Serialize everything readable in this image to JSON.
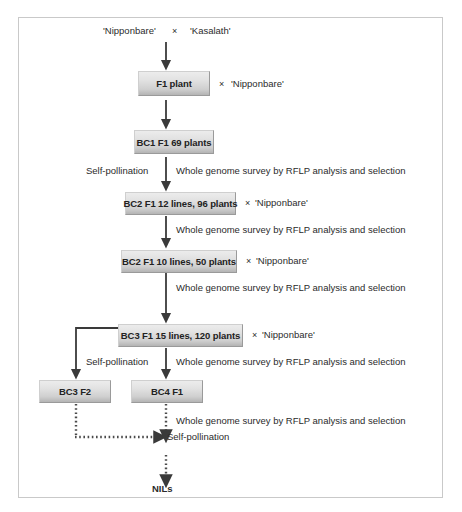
{
  "figure": {
    "frame_color": "#c9c9c9",
    "box_fill_top": "#ececec",
    "box_fill_bottom": "#b4b4b4",
    "box_border": "#9a9a9a",
    "arrow_color": "#3a3a3a",
    "text_color": "#2b2b2b"
  },
  "cross_top": {
    "parent_female": "'Nipponbare'",
    "cross_symbol": "×",
    "parent_male": "'Kasalath'"
  },
  "generations": [
    {
      "id": "f1-plant",
      "label": "F1 plant"
    },
    {
      "id": "bc1-f1",
      "label": "BC1 F1   69 plants"
    },
    {
      "id": "bc2-f1-12",
      "label": "BC2 F1 12 lines, 96 plants"
    },
    {
      "id": "bc2-f1-10",
      "label": "BC2 F1   10 lines, 50 plants"
    },
    {
      "id": "bc3-f1-15",
      "label": "BC3 F1   15 lines, 120 plants"
    },
    {
      "id": "bc3-f2",
      "label": "BC3 F2"
    },
    {
      "id": "bc4-f1",
      "label": "BC4 F1"
    }
  ],
  "recurrent_crosses": [
    {
      "id": "cross-f1",
      "symbol": "×",
      "parent": "'Nipponbare'"
    },
    {
      "id": "cross-bc2-12",
      "symbol": "×",
      "parent": "'Nipponbare'"
    },
    {
      "id": "cross-bc2-10",
      "symbol": "×",
      "parent": "'Nipponbare'"
    },
    {
      "id": "cross-bc3-15",
      "symbol": "×",
      "parent": "'Nipponbare'"
    }
  ],
  "step_labels": {
    "self_pollination": "Self-pollination",
    "rflp_survey": "Whole genome survey by RFLP analysis and selection"
  },
  "annotations": [
    {
      "id": "ann-self-1",
      "text": "Self-pollination"
    },
    {
      "id": "ann-rflp-1",
      "text": "Whole genome survey by RFLP analysis and selection"
    },
    {
      "id": "ann-rflp-2",
      "text": "Whole genome survey by RFLP analysis and selection"
    },
    {
      "id": "ann-rflp-3",
      "text": "Whole genome survey by RFLP analysis and selection"
    },
    {
      "id": "ann-self-2",
      "text": "Self-pollination"
    },
    {
      "id": "ann-rflp-4",
      "text": "Whole genome survey by RFLP analysis and selection"
    },
    {
      "id": "ann-rflp-5",
      "text": "Whole genome survey by RFLP analysis and selection"
    },
    {
      "id": "ann-self-3",
      "text": "Self-pollination"
    }
  ],
  "terminal": {
    "label": "NILs"
  }
}
